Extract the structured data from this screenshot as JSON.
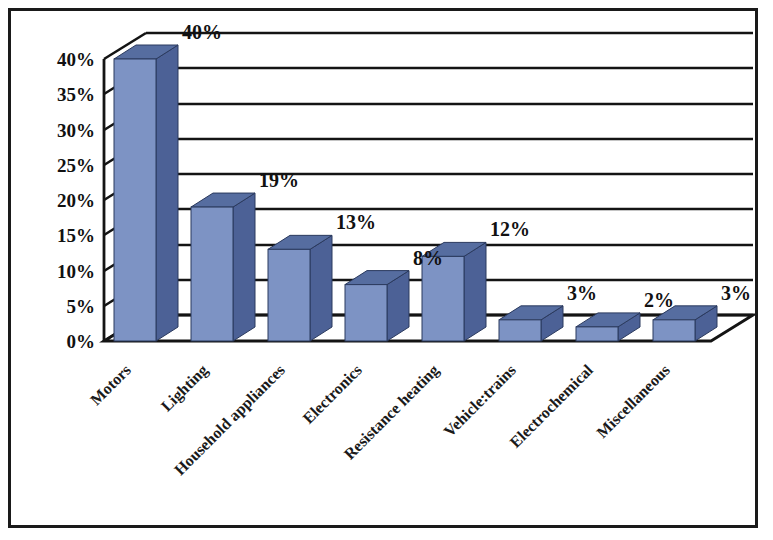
{
  "chart_data": {
    "type": "bar",
    "title": "",
    "subtitle": "",
    "xlabel": "",
    "ylabel": "",
    "categories": [
      "Motors",
      "Lighting",
      "Household appliances",
      "Electronics",
      "Resistance heating",
      "Vehicle:trains",
      "Electrochemical",
      "Miscellaneous"
    ],
    "values": [
      40,
      19,
      13,
      8,
      12,
      3,
      2,
      3
    ],
    "data_labels": [
      "40%",
      "19%",
      "13%",
      "8%",
      "12%",
      "3%",
      "2%",
      "3%"
    ],
    "ylim": [
      0,
      40
    ],
    "ytick_values": [
      0,
      5,
      10,
      15,
      20,
      25,
      30,
      35,
      40
    ],
    "ytick_labels": [
      "0%",
      "5%",
      "10%",
      "15%",
      "20%",
      "25%",
      "30%",
      "35%",
      "40%"
    ],
    "grid": true,
    "legend": "none",
    "style": "3d-column",
    "colors": {
      "bar_front": "#7d93c4",
      "bar_side": "#4c6196",
      "bar_top": "#566da0",
      "gridline": "#141414",
      "axis": "#141414",
      "text": "#111111",
      "background": "#ffffff",
      "border": "#1a1a1a"
    }
  }
}
